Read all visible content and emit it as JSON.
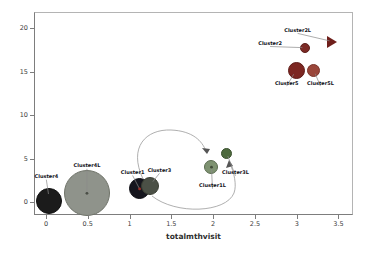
{
  "chart_data": {
    "type": "scatter",
    "title": "",
    "subtitle": "",
    "xlabel": "totalmthvisit",
    "ylabel": "",
    "xlim": [
      -0.15,
      3.67
    ],
    "ylim": [
      -1.5,
      21.8
    ],
    "grid": false,
    "legend_position": "none",
    "x_ticks": [
      {
        "value": 0,
        "label": "0"
      },
      {
        "value": 0.5,
        "label": "0.5"
      },
      {
        "value": 1,
        "label": "1"
      },
      {
        "value": 1.5,
        "label": "1.5"
      },
      {
        "value": 2,
        "label": "2"
      },
      {
        "value": 2.5,
        "label": "2.5"
      },
      {
        "value": 3,
        "label": "3"
      },
      {
        "value": 3.5,
        "label": "3.5"
      }
    ],
    "y_ticks": [
      {
        "value": 0,
        "label": "0"
      },
      {
        "value": 5,
        "label": "5"
      },
      {
        "value": 10,
        "label": "10"
      },
      {
        "value": 15,
        "label": "15"
      },
      {
        "value": 20,
        "label": "20"
      }
    ],
    "points": [
      {
        "label": "Cluster4",
        "x": 0.04,
        "y": 0.1,
        "radius_px": 13,
        "marker": "circle",
        "color": "#1b1b1b",
        "border": "#101010",
        "dot": null,
        "label_dx": -3,
        "label_dy": -25
      },
      {
        "label": "Cluster4L",
        "x": 0.49,
        "y": 1.0,
        "radius_px": 23,
        "marker": "circle",
        "color": "#8f938b",
        "border": "#6f7369",
        "dot": "#4a4e46",
        "label_dx": 0,
        "label_dy": -28
      },
      {
        "label": "Cluster1",
        "x": 1.12,
        "y": 1.5,
        "radius_px": 10.5,
        "marker": "circle",
        "color": "#16161e",
        "border": "#0c0c12",
        "dot": "#a03028",
        "label_dx": -7,
        "label_dy": -17
      },
      {
        "label": "Cluster3",
        "x": 1.25,
        "y": 1.85,
        "radius_px": 9,
        "marker": "circle",
        "color": "#4b5046",
        "border": "#3a3e33",
        "dot": null,
        "label_dx": 9,
        "label_dy": -16
      },
      {
        "label": "Cluster1L",
        "x": 1.98,
        "y": 4.0,
        "radius_px": 7,
        "marker": "circle",
        "color": "#7e9271",
        "border": "#5a6b4f",
        "dot": "#3f4a37",
        "label_dx": 1,
        "label_dy": 18
      },
      {
        "label": "Cluster3L",
        "x": 2.16,
        "y": 5.6,
        "radius_px": 5.5,
        "marker": "circle",
        "color": "#4e6a3e",
        "border": "#3c5230",
        "dot": null,
        "label_dx": 9,
        "label_dy": 19
      },
      {
        "label": "Cluster5",
        "x": 3.0,
        "y": 15.1,
        "radius_px": 8.5,
        "marker": "circle",
        "color": "#7c2621",
        "border": "#5e1b17",
        "dot": null,
        "label_dx": -10,
        "label_dy": 12
      },
      {
        "label": "Cluster5L",
        "x": 3.2,
        "y": 15.1,
        "radius_px": 6.5,
        "marker": "circle",
        "color": "#9a463a",
        "border": "#7a332a",
        "dot": null,
        "label_dx": 7,
        "label_dy": 12
      },
      {
        "label": "Cluster2",
        "x": 3.1,
        "y": 17.7,
        "radius_px": 5,
        "marker": "circle",
        "color": "#7c2a25",
        "border": "#5e201c",
        "dot": null,
        "label_dx": -35,
        "label_dy": -5
      },
      {
        "label": "Cluster2L",
        "x": 3.43,
        "y": 18.4,
        "radius_px": 6,
        "marker": "triangle-right",
        "color": "#6f1f1b",
        "border": null,
        "dot": null,
        "label_dx": -35,
        "label_dy": -12
      }
    ],
    "arrows": [
      {
        "from": "Cluster1",
        "to": "Cluster1L",
        "path_px": "M 143 179 C 128 147 146 129 171 130 C 193 131 202 141 206 151",
        "head_px": "207,154 202,148 210,149"
      },
      {
        "from": "Cluster3",
        "to": "Cluster3L",
        "path_px": "M 152 196 C 176 215 226 213 234 193 C 237 185 234 172 230 164",
        "head_px": "229,160 226,168 233,166"
      }
    ],
    "colors": {
      "arrow": "#9a9a9a",
      "leader_line": "#8a8a8a",
      "axis": "#7d7d7d",
      "tick_text": "#3c3c3c",
      "point_label_text": "#12121a"
    }
  }
}
